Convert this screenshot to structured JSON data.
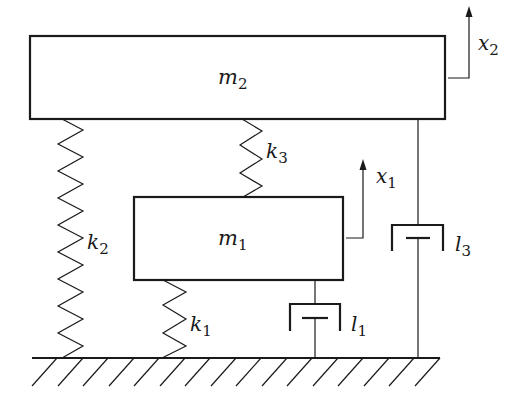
{
  "diagram": {
    "colors": {
      "stroke": "#1a1a1a",
      "background": "#ffffff"
    },
    "masses": [
      {
        "id": "m2",
        "label": "m",
        "sub": "2",
        "x": 30,
        "y": 36,
        "w": 415,
        "h": 83
      },
      {
        "id": "m1",
        "label": "m",
        "sub": "1",
        "x": 134,
        "y": 197,
        "w": 209,
        "h": 83
      }
    ],
    "springs": [
      {
        "id": "k2",
        "label": "k",
        "sub": "2",
        "from": "m2",
        "to": "ground"
      },
      {
        "id": "k3",
        "label": "k",
        "sub": "3",
        "from": "m2",
        "to": "m1"
      },
      {
        "id": "k1",
        "label": "k",
        "sub": "1",
        "from": "m1",
        "to": "ground"
      }
    ],
    "dampers": [
      {
        "id": "l3",
        "label": "l",
        "sub": "3",
        "from": "m2",
        "to": "ground"
      },
      {
        "id": "l1",
        "label": "l",
        "sub": "1",
        "from": "m1",
        "to": "ground"
      }
    ],
    "displacements": [
      {
        "id": "x2",
        "label": "x",
        "sub": "2",
        "mass": "m2"
      },
      {
        "id": "x1",
        "label": "x",
        "sub": "1",
        "mass": "m1"
      }
    ],
    "ground": {
      "y": 358,
      "x_start": 32,
      "x_end": 440
    }
  }
}
